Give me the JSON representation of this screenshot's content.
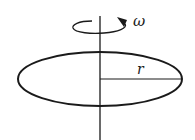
{
  "diagram": {
    "type": "rotating-disk",
    "labels": {
      "angular_velocity": "ω",
      "radius": "r"
    },
    "colors": {
      "stroke": "#1a1a1a",
      "background": "#ffffff"
    }
  }
}
